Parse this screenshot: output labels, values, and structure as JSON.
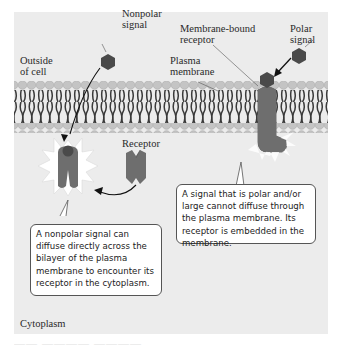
{
  "diagram": {
    "labels": {
      "nonpolar_signal": "Nonpolar\nsignal",
      "outside_of_cell": "Outside\nof cell",
      "plasma_membrane": "Plasma\nmembrane",
      "membrane_bound_receptor": "Membrane-bound\nreceptor",
      "polar_signal": "Polar\nsignal",
      "receptor": "Receptor",
      "cytoplasm": "Cytoplasm"
    },
    "callouts": {
      "nonpolar": "A nonpolar signal can diffuse directly across the bilayer of the plasma membrane to encounter its receptor in the cytoplasm.",
      "polar": "A signal that is polar and/or large cannot diffuse through the plasma membrane. Its receptor is embedded in the membrane."
    },
    "colors": {
      "panel_bg": "#ececec",
      "phospholipid_head": "#c4c4c4",
      "lipid_tail": "#3a3a3a",
      "receptor": "#6e6e6e",
      "signal": "#4a4a4a",
      "burst": "#ffffff"
    }
  }
}
